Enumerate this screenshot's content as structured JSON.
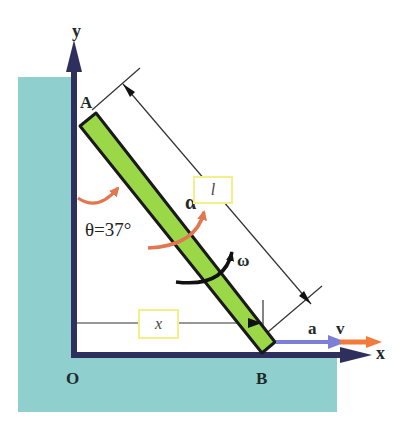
{
  "diagram": {
    "labels": {
      "y_axis": "y",
      "x_axis": "x",
      "point_a": "A",
      "point_b": "B",
      "origin": "O",
      "angle": "θ=37°",
      "angular_acceleration": "α",
      "angular_velocity": "ω",
      "acceleration": "a",
      "velocity": "v"
    },
    "boxes": {
      "length": "l",
      "horizontal_distance": "x"
    },
    "colors": {
      "wall": "#8fd0cf",
      "axis": "#2e2f5c",
      "rod": "#9bd848",
      "rod_outline": "#1a1a1a",
      "alpha_arrow": "#e2764f",
      "omega_arrow": "#111111",
      "acceleration_arrow": "#7d7fd6",
      "velocity_arrow": "#f27a3a",
      "box_border": "#f3f08a"
    }
  }
}
